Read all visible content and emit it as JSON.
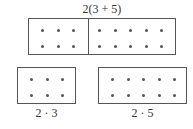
{
  "top": {
    "label": "2(3 + 5)",
    "left_group": {
      "rows": 2,
      "cols": 3
    },
    "right_group": {
      "rows": 2,
      "cols": 5
    }
  },
  "bottom_left": {
    "label": "2 · 3",
    "rows": 2,
    "cols": 3
  },
  "bottom_right": {
    "label": "2 · 5",
    "rows": 2,
    "cols": 5
  },
  "colors": {
    "line": "#555555",
    "dot": "#555555",
    "text": "#333333"
  }
}
